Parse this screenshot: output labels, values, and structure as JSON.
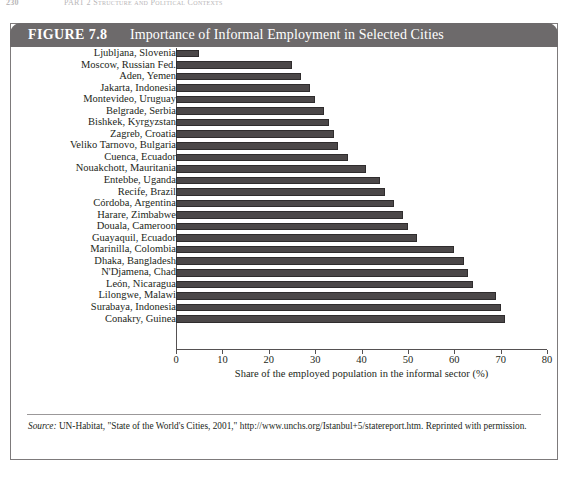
{
  "running_head": {
    "folio": "230",
    "text": "PART 2   Structure and Political Contexts"
  },
  "figure": {
    "number_label": "FIGURE 7.8",
    "title": "Importance of Informal Employment in Selected Cities",
    "header_bg": "#6d6a6b",
    "bar_color": "#4b4748"
  },
  "source_note": {
    "label": "Source:",
    "text": " UN-Habitat, \"State of the World's Cities, 2001,\" http://www.unchs.org/Istanbul+5/statereport.htm. Reprinted with permission."
  },
  "chart_data": {
    "type": "bar",
    "orientation": "horizontal",
    "title": "Importance of Informal Employment in Selected Cities",
    "xlabel": "Share of the employed population in the informal sector (%)",
    "ylabel": "",
    "xlim": [
      0,
      80
    ],
    "xticks": [
      0,
      10,
      20,
      30,
      40,
      50,
      60,
      70,
      80
    ],
    "grid": false,
    "legend": false,
    "categories": [
      "Ljubljana, Slovenia",
      "Moscow, Russian Fed.",
      "Aden, Yemen",
      "Jakarta, Indonesia",
      "Montevideo, Uruguay",
      "Belgrade, Serbia",
      "Bishkek, Kyrgyzstan",
      "Zagreb, Croatia",
      "Veliko Tarnovo, Bulgaria",
      "Cuenca, Ecuador",
      "Nouakchott, Mauritania",
      "Entebbe, Uganda",
      "Recife, Brazil",
      "Córdoba, Argentina",
      "Harare, Zimbabwe",
      "Douala, Cameroon",
      "Guayaquil, Ecuador",
      "Marinilla, Colombia",
      "Dhaka, Bangladesh",
      "N'Djamena, Chad",
      "León, Nicaragua",
      "Lilongwe, Malawi",
      "Surabaya, Indonesia",
      "Conakry, Guinea"
    ],
    "values": [
      5,
      25,
      27,
      29,
      30,
      32,
      33,
      34,
      35,
      37,
      41,
      44,
      45,
      47,
      49,
      50,
      52,
      60,
      62,
      63,
      64,
      69,
      70,
      71
    ]
  }
}
